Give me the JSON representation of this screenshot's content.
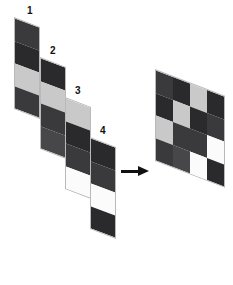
{
  "figure": {
    "type": "layer-composition-diagram",
    "background": "#ffffff",
    "arrow": {
      "name": "right-arrow",
      "direction": "right",
      "color": "#111111"
    }
  },
  "palette": {
    "dark_gray": "#3a3a3c",
    "near_black": "#2a2a2c",
    "mid_dark": "#47474a",
    "light_gray": "#c9c9c9",
    "white": "#fbfbfb",
    "outline": "#b9b9b9",
    "label": "#111111"
  },
  "panels": [
    {
      "label": "1",
      "name": "layer-panel-1",
      "left": 14,
      "top": 17,
      "width": 26,
      "height": 92,
      "label_left": 27,
      "label_top": 6,
      "bands": [
        "#3a3a3c",
        "#2a2a2c",
        "#c9c9c9",
        "#3a3a3c"
      ]
    },
    {
      "label": "2",
      "name": "layer-panel-2",
      "left": 40,
      "top": 57,
      "width": 26,
      "height": 92,
      "label_left": 50,
      "label_top": 46,
      "bands": [
        "#2a2a2c",
        "#c9c9c9",
        "#3a3a3c",
        "#47474a"
      ]
    },
    {
      "label": "3",
      "name": "layer-panel-3",
      "left": 65,
      "top": 97,
      "width": 26,
      "height": 92,
      "label_left": 75,
      "label_top": 86,
      "bands": [
        "#c9c9c9",
        "#2a2a2c",
        "#3a3a3c",
        "#fbfbfb"
      ]
    },
    {
      "label": "4",
      "name": "layer-panel-4",
      "left": 90,
      "top": 137,
      "width": 26,
      "height": 92,
      "label_left": 100,
      "label_top": 126,
      "bands": [
        "#2a2a2c",
        "#3a3a3c",
        "#fbfbfb",
        "#2a2a2c"
      ]
    }
  ],
  "result": {
    "name": "composite-grid",
    "left": 155,
    "top": 69,
    "width": 70,
    "height": 92,
    "rows": 4,
    "cols": 4,
    "columns": [
      [
        "#3a3a3c",
        "#2a2a2c",
        "#c9c9c9",
        "#3a3a3c"
      ],
      [
        "#2a2a2c",
        "#c9c9c9",
        "#3a3a3c",
        "#47474a"
      ],
      [
        "#c9c9c9",
        "#2a2a2c",
        "#3a3a3c",
        "#fbfbfb"
      ],
      [
        "#2a2a2c",
        "#3a3a3c",
        "#fbfbfb",
        "#2a2a2c"
      ]
    ]
  }
}
